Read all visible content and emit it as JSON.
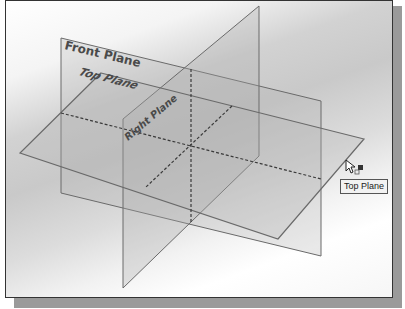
{
  "viewport": {
    "planes": [
      {
        "name": "Front Plane",
        "label": "Front Plane"
      },
      {
        "name": "Top Plane",
        "label": "Top Plane"
      },
      {
        "name": "Right Plane",
        "label": "Right Plane"
      }
    ],
    "hovered_plane": "Top Plane"
  },
  "tooltip": {
    "text": "Top Plane"
  },
  "cursor": {
    "icon": "arrow-cursor-with-plane-icon"
  },
  "colors": {
    "plane_edge": "#6a6a6a",
    "plane_fill": "#b8b8b8",
    "label_text": "#4a4a4a"
  }
}
